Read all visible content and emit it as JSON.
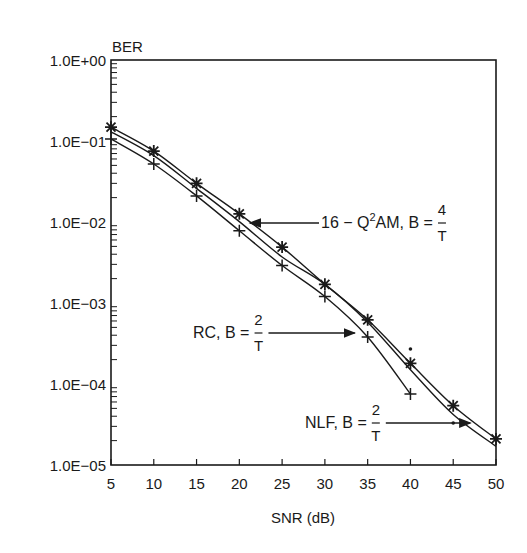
{
  "chart_data": {
    "type": "line",
    "title": "",
    "xlabel": "SNR (dB)",
    "ylabel": "BER",
    "xscale": "linear",
    "yscale": "log",
    "xlim": [
      5,
      50
    ],
    "ylim": [
      1e-05,
      1
    ],
    "grid": false,
    "x_ticks": [
      5,
      10,
      15,
      20,
      25,
      30,
      35,
      40,
      45,
      50
    ],
    "x_tick_labels": [
      "5",
      "10",
      "15",
      "20",
      "25",
      "30",
      "35",
      "40",
      "45",
      "50"
    ],
    "y_ticks": [
      1,
      0.1,
      0.01,
      0.001,
      0.0001,
      1e-05
    ],
    "y_tick_labels": [
      "1.0E+00",
      "1.0E−01",
      "1.0E−02",
      "1.0E−03",
      "1.0E−04",
      "1.0E−05"
    ],
    "series": [
      {
        "name": "16-Q²AM, B=4/T",
        "marker": "asterisk",
        "x": [
          5,
          10,
          15,
          20,
          25,
          30,
          35,
          40,
          45,
          50
        ],
        "values": [
          0.148,
          0.075,
          0.03,
          0.0126,
          0.0049,
          0.0017,
          0.00062,
          0.00018,
          5.4e-05,
          2.1e-05
        ]
      },
      {
        "name": "NLF, B=2/T",
        "marker": "dot",
        "x": [
          5,
          10,
          15,
          20,
          25,
          30,
          35,
          40,
          45,
          50
        ],
        "values": [
          0.13,
          0.066,
          0.026,
          0.0101,
          0.0037,
          0.0017,
          0.00058,
          0.00015,
          4.2e-05,
          1.7e-05
        ],
        "isolated_points": [
          [
            40,
            0.00027
          ],
          [
            45,
            3.3e-05
          ]
        ]
      },
      {
        "name": "RC, B=2/T",
        "marker": "plus",
        "x": [
          5,
          10,
          15,
          20,
          25,
          30,
          35,
          40
        ],
        "values": [
          0.106,
          0.052,
          0.021,
          0.0078,
          0.0029,
          0.0012,
          0.00038,
          7.5e-05
        ]
      }
    ],
    "annotations": [
      {
        "id": "q2am",
        "prefix": "16 − Q",
        "sup": "2",
        "suffix": "AM,  B =",
        "num": "4",
        "den": "T",
        "points_to": [
          21,
          0.012
        ]
      },
      {
        "id": "rc",
        "prefix": "RC,  B =",
        "num": "2",
        "den": "T",
        "points_to": [
          33.5,
          0.0004
        ]
      },
      {
        "id": "nlf",
        "prefix": "NLF,  B =",
        "num": "2",
        "den": "T",
        "points_to": [
          47,
          2.8e-05
        ]
      }
    ],
    "legend": "none (inline arrow annotations)"
  }
}
